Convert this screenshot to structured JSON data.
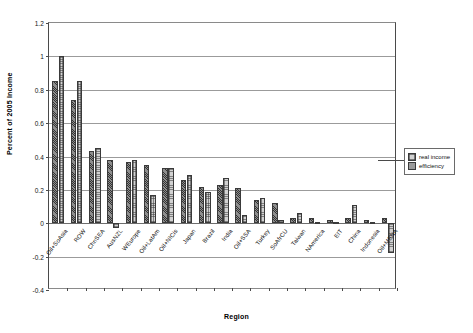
{
  "chart_data": {
    "type": "bar",
    "title": "",
    "xlabel": "Region",
    "ylabel": "Percent of 2005 Income",
    "ylim": [
      -0.4,
      1.2
    ],
    "ytick_labels": [
      "1.2",
      "1",
      "0.8",
      "0.6",
      "0.4",
      "0.2",
      "0",
      "-0.2",
      "-0.4"
    ],
    "ytick_values": [
      1.2,
      1,
      0.8,
      0.6,
      0.4,
      0.2,
      0,
      -0.2,
      -0.4
    ],
    "grid": true,
    "legend_position": "right",
    "categories": [
      "Oil+SoAsia",
      "ROW",
      "ChnSEA",
      "AusNZL",
      "WEurope",
      "Oil+LatAm",
      "Oil+NICis",
      "Japan",
      "Brazil",
      "India",
      "Oil+SSA",
      "Turkey",
      "SoAfrCU",
      "Taiwan",
      "NAmerica",
      "EIT",
      "China",
      "Indonesia",
      "Oil+MENA"
    ],
    "series": [
      {
        "name": "real income",
        "pattern": "hatch",
        "color": "#8e8e8e",
        "values": [
          0.85,
          0.74,
          0.43,
          0.38,
          0.37,
          0.35,
          0.33,
          0.26,
          0.22,
          0.23,
          0.21,
          0.14,
          0.12,
          0.03,
          0.03,
          0.02,
          0.03,
          0.02,
          0.03
        ]
      },
      {
        "name": "efficiency",
        "pattern": "checker",
        "color": "#d2d2d2",
        "values": [
          1.0,
          0.85,
          0.45,
          -0.03,
          0.38,
          0.17,
          0.33,
          0.29,
          0.19,
          0.27,
          0.05,
          0.15,
          0.02,
          0.06,
          0.01,
          0.01,
          0.11,
          0.01,
          -0.18
        ]
      }
    ]
  },
  "legend": {
    "items": [
      {
        "label": "real income"
      },
      {
        "label": "efficiency"
      }
    ]
  }
}
